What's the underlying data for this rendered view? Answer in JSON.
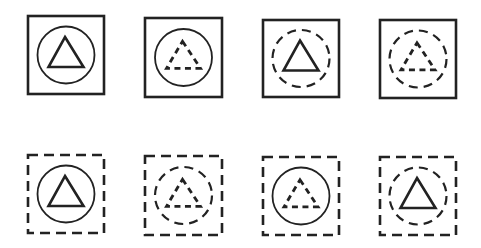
{
  "figure": {
    "stroke_color": "#222222",
    "background": "#ffffff",
    "items": [
      {
        "row": 1,
        "col": 1,
        "square": "solid",
        "circle": "solid",
        "triangle": "solid",
        "x": 28,
        "y": 16,
        "w": 76,
        "h": 78
      },
      {
        "row": 1,
        "col": 2,
        "square": "solid",
        "circle": "solid",
        "triangle": "dashed",
        "x": 145,
        "y": 18,
        "w": 77,
        "h": 79
      },
      {
        "row": 1,
        "col": 3,
        "square": "solid",
        "circle": "dashed",
        "triangle": "solid",
        "x": 263,
        "y": 20,
        "w": 76,
        "h": 77
      },
      {
        "row": 1,
        "col": 4,
        "square": "solid",
        "circle": "dashed",
        "triangle": "dashed",
        "x": 380,
        "y": 20,
        "w": 76,
        "h": 78
      },
      {
        "row": 2,
        "col": 1,
        "square": "dashed",
        "circle": "solid",
        "triangle": "solid",
        "x": 28,
        "y": 155,
        "w": 76,
        "h": 78
      },
      {
        "row": 2,
        "col": 2,
        "square": "dashed",
        "circle": "dashed",
        "triangle": "dashed",
        "x": 145,
        "y": 156,
        "w": 77,
        "h": 79
      },
      {
        "row": 2,
        "col": 3,
        "square": "dashed",
        "circle": "solid",
        "triangle": "dashed",
        "x": 263,
        "y": 157,
        "w": 76,
        "h": 78
      },
      {
        "row": 2,
        "col": 4,
        "square": "dashed",
        "circle": "dashed",
        "triangle": "solid",
        "x": 380,
        "y": 157,
        "w": 76,
        "h": 78
      }
    ]
  }
}
